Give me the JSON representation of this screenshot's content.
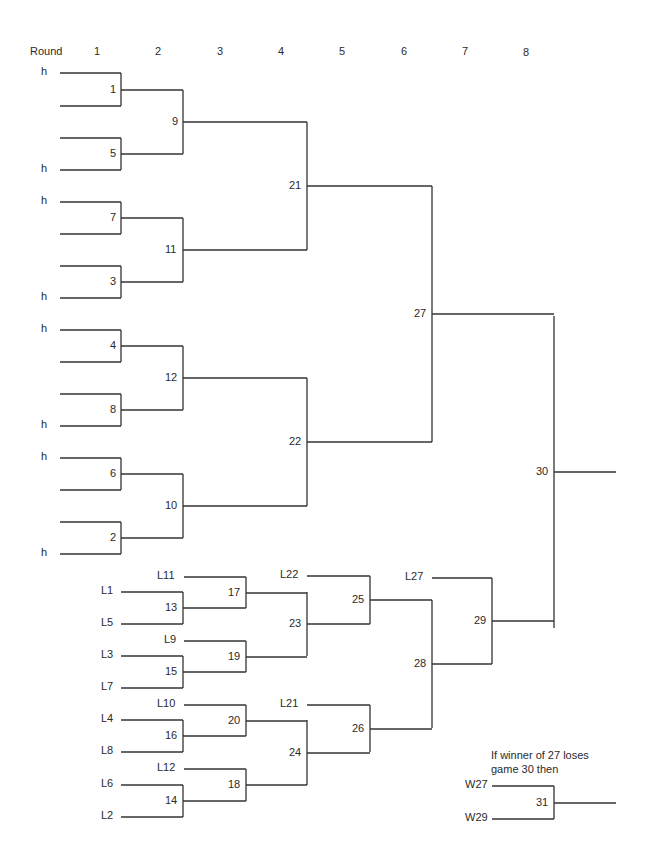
{
  "header": {
    "round_label": "Round",
    "rounds": [
      "1",
      "2",
      "3",
      "4",
      "5",
      "6",
      "7",
      "8"
    ]
  },
  "line_color": "#333333",
  "note": {
    "line1": "If winner of 27 loses",
    "line2": "game 30 then"
  },
  "entrant_labels": [
    {
      "text": "h",
      "x": 50,
      "y": 73
    },
    {
      "text": "h",
      "x": 50,
      "y": 170
    },
    {
      "text": "h",
      "x": 50,
      "y": 202
    },
    {
      "text": "h",
      "x": 50,
      "y": 298
    },
    {
      "text": "h",
      "x": 50,
      "y": 330
    },
    {
      "text": "h",
      "x": 50,
      "y": 426
    },
    {
      "text": "h",
      "x": 50,
      "y": 458
    },
    {
      "text": "h",
      "x": 50,
      "y": 554
    },
    {
      "text": "L11",
      "x": 180,
      "y": 577
    },
    {
      "text": "L1",
      "x": 117,
      "y": 592
    },
    {
      "text": "L5",
      "x": 117,
      "y": 624
    },
    {
      "text": "L9",
      "x": 180,
      "y": 641
    },
    {
      "text": "L3",
      "x": 117,
      "y": 656
    },
    {
      "text": "L7",
      "x": 117,
      "y": 688
    },
    {
      "text": "L10",
      "x": 180,
      "y": 705
    },
    {
      "text": "L4",
      "x": 117,
      "y": 720
    },
    {
      "text": "L8",
      "x": 117,
      "y": 752
    },
    {
      "text": "L12",
      "x": 180,
      "y": 769
    },
    {
      "text": "L6",
      "x": 117,
      "y": 785
    },
    {
      "text": "L2",
      "x": 117,
      "y": 817
    },
    {
      "text": "L22",
      "x": 303,
      "y": 576
    },
    {
      "text": "L21",
      "x": 303,
      "y": 705
    },
    {
      "text": "L27",
      "x": 428,
      "y": 578
    },
    {
      "text": "W27",
      "x": 488,
      "y": 786
    },
    {
      "text": "W29",
      "x": 488,
      "y": 819
    }
  ],
  "games": [
    {
      "id": "1",
      "x": 121,
      "y1": 73,
      "y2": 106,
      "out_to": 183
    },
    {
      "id": "5",
      "x": 121,
      "y1": 138,
      "y2": 170,
      "out_to": 183
    },
    {
      "id": "7",
      "x": 121,
      "y1": 202,
      "y2": 234,
      "out_to": 183
    },
    {
      "id": "3",
      "x": 121,
      "y1": 266,
      "y2": 298,
      "out_to": 183
    },
    {
      "id": "4",
      "x": 121,
      "y1": 330,
      "y2": 362,
      "out_to": 183
    },
    {
      "id": "8",
      "x": 121,
      "y1": 394,
      "y2": 426,
      "out_to": 183
    },
    {
      "id": "6",
      "x": 121,
      "y1": 458,
      "y2": 490,
      "out_to": 183
    },
    {
      "id": "2",
      "x": 121,
      "y1": 522,
      "y2": 554,
      "out_to": 183
    },
    {
      "id": "9",
      "x": 183,
      "y1": 90,
      "y2": 154,
      "out_to": 307
    },
    {
      "id": "11",
      "x": 183,
      "y1": 218,
      "y2": 282,
      "out_to": 307
    },
    {
      "id": "12",
      "x": 183,
      "y1": 346,
      "y2": 410,
      "out_to": 307
    },
    {
      "id": "10",
      "x": 183,
      "y1": 474,
      "y2": 538,
      "out_to": 307
    },
    {
      "id": "21",
      "x": 307,
      "y1": 122,
      "y2": 250,
      "out_to": 432
    },
    {
      "id": "22",
      "x": 307,
      "y1": 378,
      "y2": 506,
      "out_to": 432
    },
    {
      "id": "27",
      "x": 432,
      "y1": 186,
      "y2": 442,
      "out_to": 554
    },
    {
      "id": "30",
      "x": 554,
      "y1": 316,
      "y2": 628,
      "out_to": 616
    },
    {
      "id": "13",
      "x": 183,
      "y1": 592,
      "y2": 624,
      "out_to": 246
    },
    {
      "id": "15",
      "x": 183,
      "y1": 656,
      "y2": 688,
      "out_to": 246
    },
    {
      "id": "16",
      "x": 183,
      "y1": 720,
      "y2": 752,
      "out_to": 246
    },
    {
      "id": "14",
      "x": 183,
      "y1": 785,
      "y2": 817,
      "out_to": 246
    },
    {
      "id": "17",
      "x": 246,
      "y1": 577,
      "y2": 608,
      "out_to": 307
    },
    {
      "id": "19",
      "x": 246,
      "y1": 641,
      "y2": 672,
      "out_to": 307
    },
    {
      "id": "20",
      "x": 246,
      "y1": 705,
      "y2": 736,
      "out_to": 307
    },
    {
      "id": "18",
      "x": 246,
      "y1": 769,
      "y2": 801,
      "out_to": 307
    },
    {
      "id": "23",
      "x": 307,
      "y1": 592,
      "y2": 656,
      "out_to": 370
    },
    {
      "id": "24",
      "x": 307,
      "y1": 720,
      "y2": 785,
      "out_to": 370
    },
    {
      "id": "25",
      "x": 370,
      "y1": 576,
      "y2": 624,
      "out_to": 432
    },
    {
      "id": "26",
      "x": 370,
      "y1": 705,
      "y2": 752,
      "out_to": 432
    },
    {
      "id": "28",
      "x": 432,
      "y1": 600,
      "y2": 728,
      "out_to": 492
    },
    {
      "id": "29",
      "x": 492,
      "y1": 578,
      "y2": 664,
      "out_to": 554
    },
    {
      "id": "31",
      "x": 554,
      "y1": 786,
      "y2": 819,
      "out_to": 616
    }
  ],
  "entry_lines": [
    {
      "x1": 60,
      "x2": 121,
      "y": 73
    },
    {
      "x1": 60,
      "x2": 121,
      "y": 106
    },
    {
      "x1": 60,
      "x2": 121,
      "y": 138
    },
    {
      "x1": 60,
      "x2": 121,
      "y": 170
    },
    {
      "x1": 60,
      "x2": 121,
      "y": 202
    },
    {
      "x1": 60,
      "x2": 121,
      "y": 234
    },
    {
      "x1": 60,
      "x2": 121,
      "y": 266
    },
    {
      "x1": 60,
      "x2": 121,
      "y": 298
    },
    {
      "x1": 60,
      "x2": 121,
      "y": 330
    },
    {
      "x1": 60,
      "x2": 121,
      "y": 362
    },
    {
      "x1": 60,
      "x2": 121,
      "y": 394
    },
    {
      "x1": 60,
      "x2": 121,
      "y": 426
    },
    {
      "x1": 60,
      "x2": 121,
      "y": 458
    },
    {
      "x1": 60,
      "x2": 121,
      "y": 490
    },
    {
      "x1": 60,
      "x2": 121,
      "y": 522
    },
    {
      "x1": 60,
      "x2": 121,
      "y": 554
    },
    {
      "x1": 121,
      "x2": 183,
      "y": 592
    },
    {
      "x1": 121,
      "x2": 183,
      "y": 624
    },
    {
      "x1": 121,
      "x2": 183,
      "y": 656
    },
    {
      "x1": 121,
      "x2": 183,
      "y": 688
    },
    {
      "x1": 121,
      "x2": 183,
      "y": 720
    },
    {
      "x1": 121,
      "x2": 183,
      "y": 752
    },
    {
      "x1": 121,
      "x2": 183,
      "y": 785
    },
    {
      "x1": 121,
      "x2": 183,
      "y": 817
    },
    {
      "x1": 184,
      "x2": 246,
      "y": 577
    },
    {
      "x1": 184,
      "x2": 246,
      "y": 641
    },
    {
      "x1": 184,
      "x2": 246,
      "y": 705
    },
    {
      "x1": 184,
      "x2": 246,
      "y": 769
    },
    {
      "x1": 307,
      "x2": 370,
      "y": 576
    },
    {
      "x1": 307,
      "x2": 370,
      "y": 705
    },
    {
      "x1": 432,
      "x2": 492,
      "y": 578
    },
    {
      "x1": 492,
      "x2": 554,
      "y": 786
    },
    {
      "x1": 492,
      "x2": 554,
      "y": 819
    }
  ]
}
